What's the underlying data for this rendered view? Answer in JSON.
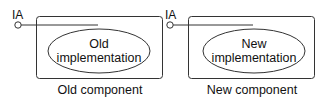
{
  "diagram": {
    "stroke_color": "#333333",
    "panels": [
      {
        "interface_label": "IA",
        "inner_label_line1": "Old",
        "inner_label_line2": "implementation",
        "caption": "Old component"
      },
      {
        "interface_label": "IA",
        "inner_label_line1": "New",
        "inner_label_line2": "implementation",
        "caption": "New component"
      }
    ]
  }
}
